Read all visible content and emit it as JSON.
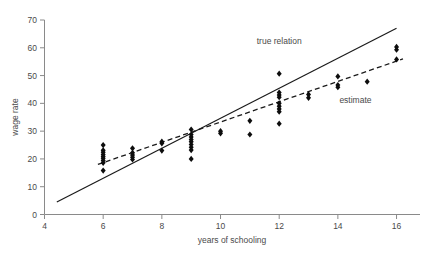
{
  "chart_data": {
    "type": "scatter",
    "title": "",
    "xlabel": "years of schooling",
    "ylabel": "wage rate",
    "xlim": [
      4,
      16.8
    ],
    "ylim": [
      0,
      70
    ],
    "xticks": [
      4,
      6,
      8,
      10,
      12,
      14,
      16
    ],
    "yticks": [
      0,
      10,
      20,
      30,
      40,
      50,
      60,
      70
    ],
    "grid": false,
    "legend_position": "inline-annotations",
    "annotations": [
      {
        "text": "true relation",
        "x": 12.0,
        "y": 61.5
      },
      {
        "text": "estimate",
        "x": 14.6,
        "y": 40.0
      }
    ],
    "points": [
      {
        "x": 6,
        "y": 15.8
      },
      {
        "x": 6,
        "y": 18.6
      },
      {
        "x": 6,
        "y": 19.4
      },
      {
        "x": 6,
        "y": 20.2
      },
      {
        "x": 6,
        "y": 20.9
      },
      {
        "x": 6,
        "y": 21.6
      },
      {
        "x": 6,
        "y": 22.4
      },
      {
        "x": 6,
        "y": 23.1
      },
      {
        "x": 6,
        "y": 25.0
      },
      {
        "x": 7,
        "y": 19.8
      },
      {
        "x": 7,
        "y": 20.6
      },
      {
        "x": 7,
        "y": 21.4
      },
      {
        "x": 7,
        "y": 22.2
      },
      {
        "x": 7,
        "y": 23.8
      },
      {
        "x": 8,
        "y": 23.0
      },
      {
        "x": 8,
        "y": 25.6
      },
      {
        "x": 8,
        "y": 26.2
      },
      {
        "x": 9,
        "y": 20.0
      },
      {
        "x": 9,
        "y": 23.2
      },
      {
        "x": 9,
        "y": 24.2
      },
      {
        "x": 9,
        "y": 25.2
      },
      {
        "x": 9,
        "y": 26.2
      },
      {
        "x": 9,
        "y": 27.0
      },
      {
        "x": 9,
        "y": 27.9
      },
      {
        "x": 9,
        "y": 28.8
      },
      {
        "x": 9,
        "y": 30.6
      },
      {
        "x": 10,
        "y": 29.2
      },
      {
        "x": 10,
        "y": 30.0
      },
      {
        "x": 11,
        "y": 28.8
      },
      {
        "x": 11,
        "y": 33.7
      },
      {
        "x": 12,
        "y": 32.7
      },
      {
        "x": 12,
        "y": 37.0
      },
      {
        "x": 12,
        "y": 38.0
      },
      {
        "x": 12,
        "y": 39.0
      },
      {
        "x": 12,
        "y": 40.0
      },
      {
        "x": 12,
        "y": 42.2
      },
      {
        "x": 12,
        "y": 43.0
      },
      {
        "x": 12,
        "y": 43.9
      },
      {
        "x": 12,
        "y": 50.7
      },
      {
        "x": 13,
        "y": 42.0
      },
      {
        "x": 13,
        "y": 43.2
      },
      {
        "x": 14,
        "y": 45.8
      },
      {
        "x": 14,
        "y": 46.6
      },
      {
        "x": 14,
        "y": 49.7
      },
      {
        "x": 15,
        "y": 47.8
      },
      {
        "x": 16,
        "y": 55.8
      },
      {
        "x": 16,
        "y": 59.3
      },
      {
        "x": 16,
        "y": 60.3
      }
    ],
    "lines": [
      {
        "name": "true relation",
        "style": "solid",
        "x0": 4.42,
        "y0": 4.5,
        "x1": 16.0,
        "y1": 67.0
      },
      {
        "name": "estimate",
        "style": "dashed",
        "x0": 5.82,
        "y0": 18.0,
        "x1": 16.22,
        "y1": 56.0
      }
    ]
  },
  "axes": {
    "y_title": "wage rate",
    "x_title": "years of schooling",
    "x_tick_labels": [
      "4",
      "6",
      "8",
      "10",
      "12",
      "14",
      "16"
    ],
    "y_tick_labels": [
      "0",
      "10",
      "20",
      "30",
      "40",
      "50",
      "60",
      "70"
    ]
  },
  "colors": {
    "axis": "#8a8a8a",
    "text": "#4a4a4a",
    "line": "#1a1a1a",
    "dot": "#0d0d0d",
    "background": "#ffffff"
  }
}
